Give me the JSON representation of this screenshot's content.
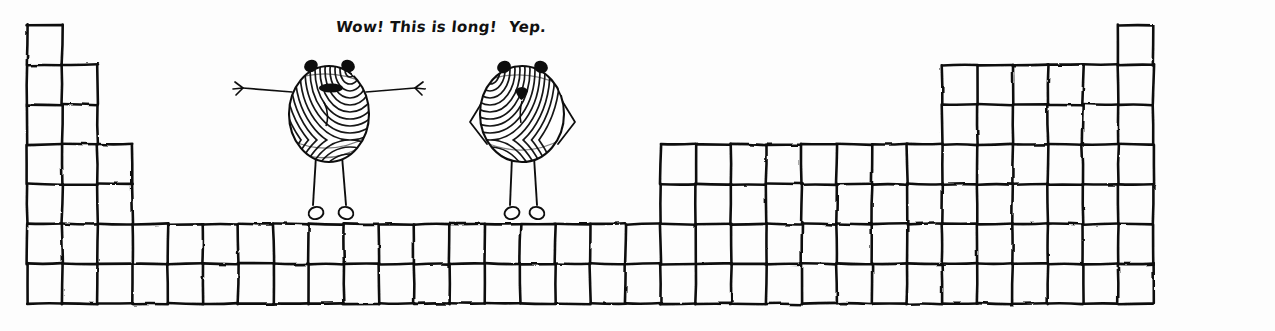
{
  "scene": {
    "title": "Hand-drawn wide-form periodic table cartoon",
    "background_color": "#fdfdfd",
    "ink_color": "#111111",
    "width": 1275,
    "height": 331
  },
  "captions": [
    {
      "id": "left",
      "text": "Wow!  This is long!",
      "x": 336,
      "y": 18
    },
    {
      "id": "right",
      "text": "Yep.",
      "x": 509,
      "y": 18
    }
  ],
  "characters": [
    {
      "id": "left-figure",
      "name": "fingerprint-creature-arms-out",
      "pose": "arms outstretched",
      "body_cx": 329,
      "body_cy": 114,
      "body_rx": 40,
      "body_ry": 48,
      "speaks": "Wow!  This is long!"
    },
    {
      "id": "right-figure",
      "name": "fingerprint-creature-hands-on-hips",
      "pose": "hands on hips",
      "body_cx": 522,
      "body_cy": 114,
      "body_rx": 42,
      "body_ry": 48,
      "speaks": "Yep."
    }
  ],
  "grid": {
    "type": "periodic-table-wide-form",
    "cell_width": 35.2,
    "cell_height": 39.8,
    "origin_x": 27,
    "origin_y": 25,
    "columns": 32,
    "rows": 7,
    "description": "32-column long-form periodic table, 7 periods, with s-block left, f+d block middle, p-block right, helium raised at far right column.",
    "row_spans": [
      {
        "row": 1,
        "segments": [
          {
            "start_col": 1,
            "end_col": 1
          },
          {
            "start_col": 32,
            "end_col": 32
          }
        ]
      },
      {
        "row": 2,
        "segments": [
          {
            "start_col": 1,
            "end_col": 2
          },
          {
            "start_col": 27,
            "end_col": 32
          }
        ]
      },
      {
        "row": 3,
        "segments": [
          {
            "start_col": 1,
            "end_col": 2
          },
          {
            "start_col": 27,
            "end_col": 32
          }
        ]
      },
      {
        "row": 4,
        "segments": [
          {
            "start_col": 1,
            "end_col": 3
          },
          {
            "start_col": 19,
            "end_col": 32
          }
        ]
      },
      {
        "row": 5,
        "segments": [
          {
            "start_col": 1,
            "end_col": 3
          },
          {
            "start_col": 19,
            "end_col": 32
          }
        ]
      },
      {
        "row": 6,
        "segments": [
          {
            "start_col": 1,
            "end_col": 32
          }
        ]
      },
      {
        "row": 7,
        "segments": [
          {
            "start_col": 1,
            "end_col": 32
          }
        ]
      }
    ]
  }
}
